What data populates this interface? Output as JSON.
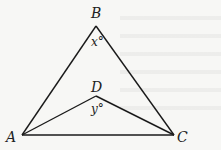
{
  "figure": {
    "type": "geometry",
    "points": {
      "A": {
        "label": "A",
        "x": 22,
        "y": 135
      },
      "B": {
        "label": "B",
        "x": 96,
        "y": 26
      },
      "C": {
        "label": "C",
        "x": 174,
        "y": 135
      },
      "D": {
        "label": "D",
        "x": 96,
        "y": 96
      }
    },
    "segments": [
      "AB",
      "BC",
      "AC",
      "AD",
      "DC"
    ],
    "angles": {
      "B": {
        "label": "x°",
        "vertex": "B"
      },
      "D": {
        "label": "y°",
        "vertex": "D"
      }
    },
    "line_color": "#1a1a1a",
    "background": "#f7f7f5"
  }
}
